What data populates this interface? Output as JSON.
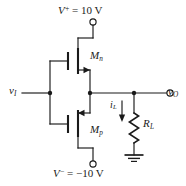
{
  "figure": {
    "background_color": "#ffffff",
    "ink_color": "#1a1a1a",
    "width": 186,
    "height": 186
  },
  "labels": {
    "supply_positive": "V+ = 10 V",
    "supply_positive_symbol": "V",
    "supply_positive_sign": "+",
    "supply_positive_value": "= 10 V",
    "supply_negative_symbol": "V",
    "supply_negative_sign": "−",
    "supply_negative_value": "= −10 V",
    "supply_negative": "V− = −10 V",
    "transistor_n_symbol": "M",
    "transistor_n_sub": "n",
    "transistor_p_symbol": "M",
    "transistor_p_sub": "p",
    "input_symbol": "v",
    "input_sub": "I",
    "output_symbol": "v",
    "output_sub": "O",
    "load_current_symbol": "i",
    "load_current_sub": "L",
    "load_resistor_symbol": "R",
    "load_resistor_sub": "L"
  },
  "components": {
    "nmos": {
      "name": "M_n",
      "type": "n-channel MOSFET",
      "source_arrow_direction": "right"
    },
    "pmos": {
      "name": "M_p",
      "type": "p-channel MOSFET",
      "source_arrow_direction": "left"
    },
    "load_resistor": {
      "name": "R_L",
      "type": "resistor",
      "zigzag_peaks": 6
    },
    "ground": {
      "name": "ground",
      "type": "earth-ground",
      "bars": 3
    },
    "load_current": {
      "name": "i_L",
      "arrow_direction": "down"
    }
  },
  "terminals": [
    {
      "name": "positive-supply-terminal",
      "label": "V+ = 10 V",
      "style": "open-circle"
    },
    {
      "name": "negative-supply-terminal",
      "label": "V− = −10 V",
      "style": "open-circle"
    },
    {
      "name": "output-terminal",
      "label": "v_O",
      "style": "open-circle"
    }
  ],
  "nodes": [
    {
      "name": "input-gate-junction"
    },
    {
      "name": "output-node-junction"
    },
    {
      "name": "load-branch-junction"
    }
  ]
}
